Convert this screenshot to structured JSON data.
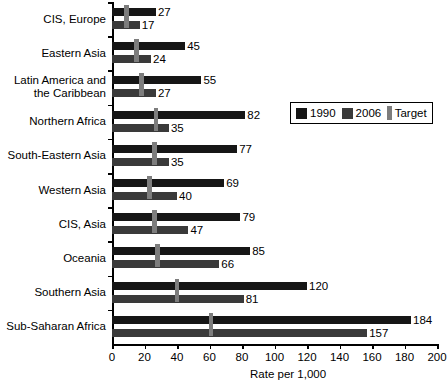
{
  "chart_data": {
    "type": "bar",
    "orientation": "horizontal",
    "title": "",
    "subtitle": "",
    "xlabel": "Rate per 1,000",
    "ylabel": "",
    "xlim": [
      0,
      200
    ],
    "xticks": [
      0,
      20,
      40,
      60,
      80,
      100,
      120,
      140,
      160,
      180,
      200
    ],
    "grid": false,
    "legend_position": "inside-right",
    "categories": [
      "CIS, Europe",
      "Eastern Asia",
      "Latin America and the Caribbean",
      "Northern Africa",
      "South-Eastern Asia",
      "Western Asia",
      "CIS, Asia",
      "Oceania",
      "Southern Asia",
      "Sub-Saharan Africa"
    ],
    "category_lines": [
      [
        "CIS, Europe"
      ],
      [
        "Eastern Asia"
      ],
      [
        "Latin America and",
        "the Caribbean"
      ],
      [
        "Northern Africa"
      ],
      [
        "South-Eastern Asia"
      ],
      [
        "Western Asia"
      ],
      [
        "CIS, Asia"
      ],
      [
        "Oceania"
      ],
      [
        "Southern Asia"
      ],
      [
        "Sub-Saharan Africa"
      ]
    ],
    "series": [
      {
        "name": "1990",
        "color": "#161616",
        "values": [
          27,
          45,
          55,
          82,
          77,
          69,
          79,
          85,
          120,
          184
        ],
        "labels": [
          "27",
          "45",
          "55",
          "82",
          "77",
          "69",
          "79",
          "85",
          "120",
          "184"
        ]
      },
      {
        "name": "2006",
        "color": "#3a3a3a",
        "values": [
          17,
          24,
          27,
          35,
          35,
          40,
          47,
          66,
          81,
          157
        ],
        "labels": [
          "17",
          "24",
          "27",
          "35",
          "35",
          "40",
          "47",
          "66",
          "81",
          "157"
        ]
      },
      {
        "name": "Target",
        "color": "#7d7d7d",
        "marker": "vertical-tick",
        "values": [
          9,
          15,
          18,
          27,
          26,
          23,
          26,
          28,
          40,
          61
        ]
      }
    ]
  },
  "legend": {
    "items": [
      {
        "label": "1990",
        "swatch": "square",
        "color": "#161616"
      },
      {
        "label": "2006",
        "swatch": "square",
        "color": "#3a3a3a"
      },
      {
        "label": "Target",
        "swatch": "vertical-bar",
        "color": "#7d7d7d"
      }
    ]
  }
}
